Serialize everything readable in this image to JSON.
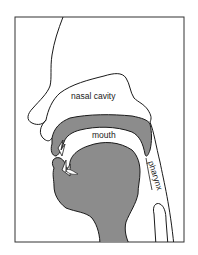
{
  "diagram": {
    "type": "anatomical-cross-section",
    "labels": {
      "nasal_cavity": "nasal cavity",
      "mouth": "mouth",
      "pharynx": "pharynx"
    },
    "colors": {
      "outline": "#1a1a1a",
      "fill_grey": "#8c8c8c",
      "background": "#ffffff",
      "frame": "#333333"
    }
  }
}
